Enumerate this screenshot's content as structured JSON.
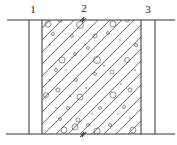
{
  "diagram": {
    "labels": [
      {
        "id": "1",
        "text": "1",
        "x": 33,
        "y": 13
      },
      {
        "id": "2",
        "text": "2",
        "x": 84,
        "y": 12
      },
      {
        "id": "3",
        "text": "3",
        "x": 148,
        "y": 13
      }
    ],
    "layers": [
      {
        "id": "1",
        "name": "left-layer",
        "fill": "blank"
      },
      {
        "id": "2",
        "name": "middle-layer",
        "fill": "hatched-aggregate"
      },
      {
        "id": "3",
        "name": "right-layer",
        "fill": "blank"
      }
    ],
    "colors": {
      "line": "#333333",
      "background": "#ffffff"
    }
  }
}
